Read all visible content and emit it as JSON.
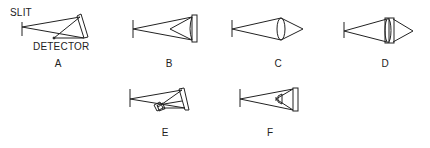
{
  "labels": {
    "slit": "SLIT",
    "detector": "DETECTOR"
  },
  "panels": [
    {
      "id": "A",
      "label": "A",
      "description": "Littrow-type mirror with slit and detector near apex"
    },
    {
      "id": "B",
      "label": "B",
      "description": "Concave mirror focusing back to detector in beam"
    },
    {
      "id": "C",
      "label": "C",
      "description": "Single lens focusing onto detector"
    },
    {
      "id": "D",
      "label": "D",
      "description": "Doublet lens focusing onto detector"
    },
    {
      "id": "E",
      "label": "E",
      "description": "Mirror with offset detector housing"
    },
    {
      "id": "F",
      "label": "F",
      "description": "Mirror with detector inside converging cone"
    }
  ],
  "colors": {
    "line": "#222222",
    "background": "#ffffff"
  }
}
